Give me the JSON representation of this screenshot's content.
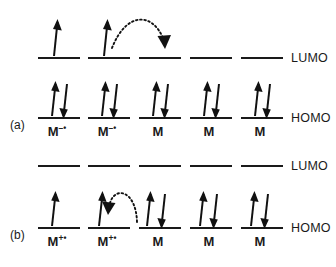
{
  "figure": {
    "background": "#ffffff",
    "ink": "#1a1a1a",
    "panels": [
      {
        "id": "a",
        "label": "(a)",
        "levels": {
          "lumo_label": "LUMO",
          "homo_label": "HOMO"
        },
        "hop_arrow": {
          "from_column": 2,
          "to_column": 3,
          "level": "LUMO",
          "direction": "left-to-right",
          "style": "dotted-curved"
        },
        "columns": [
          {
            "index": 1,
            "species": "M",
            "charge": "–",
            "radical": "•",
            "lumo_electrons": [
              "up"
            ],
            "homo_electrons": [
              "up",
              "down"
            ]
          },
          {
            "index": 2,
            "species": "M",
            "charge": "–",
            "radical": "•",
            "lumo_electrons": [
              "up"
            ],
            "homo_electrons": [
              "up",
              "down"
            ]
          },
          {
            "index": 3,
            "species": "M",
            "charge": "",
            "radical": "",
            "lumo_electrons": [],
            "homo_electrons": [
              "up",
              "down"
            ]
          },
          {
            "index": 4,
            "species": "M",
            "charge": "",
            "radical": "",
            "lumo_electrons": [],
            "homo_electrons": [
              "up",
              "down"
            ]
          },
          {
            "index": 5,
            "species": "M",
            "charge": "",
            "radical": "",
            "lumo_electrons": [],
            "homo_electrons": [
              "up",
              "down"
            ]
          }
        ]
      },
      {
        "id": "b",
        "label": "(b)",
        "levels": {
          "lumo_label": "LUMO",
          "homo_label": "HOMO"
        },
        "hop_arrow": {
          "from_column": 3,
          "to_column": 2,
          "level": "HOMO",
          "direction": "right-to-left",
          "style": "dotted-curved"
        },
        "columns": [
          {
            "index": 1,
            "species": "M",
            "charge": "+",
            "radical": "•",
            "lumo_electrons": [],
            "homo_electrons": [
              "up"
            ]
          },
          {
            "index": 2,
            "species": "M",
            "charge": "+",
            "radical": "•",
            "lumo_electrons": [],
            "homo_electrons": [
              "up"
            ]
          },
          {
            "index": 3,
            "species": "M",
            "charge": "",
            "radical": "",
            "lumo_electrons": [],
            "homo_electrons": [
              "up",
              "down"
            ]
          },
          {
            "index": 4,
            "species": "M",
            "charge": "",
            "radical": "",
            "lumo_electrons": [],
            "homo_electrons": [
              "up",
              "down"
            ]
          },
          {
            "index": 5,
            "species": "M",
            "charge": "",
            "radical": "",
            "lumo_electrons": [],
            "homo_electrons": [
              "up",
              "down"
            ]
          }
        ]
      }
    ]
  }
}
